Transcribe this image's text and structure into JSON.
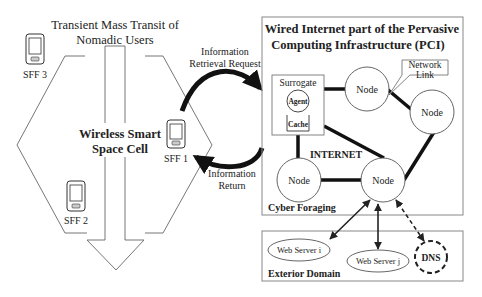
{
  "left": {
    "title_line1": "Transient Mass Transit of",
    "title_line2": "Nomadic Users",
    "cell_line1": "Wireless Smart",
    "cell_line2": "Space Cell",
    "devices": [
      {
        "label": "SFF 3"
      },
      {
        "label": "SFF 1"
      },
      {
        "label": "SFF 2"
      }
    ]
  },
  "arrows": {
    "request_line1": "Information",
    "request_line2": "Retrieval Request",
    "return_line1": "Information",
    "return_line2": "Return"
  },
  "pci": {
    "title_line1": "Wired Internet part of the Pervasive",
    "title_line2": "Computing Infrastructure (PCI)",
    "surrogate_label": "Surrogate",
    "agent_label": "Agent",
    "cache_label": "Cache",
    "network_link_line1": "Network",
    "network_link_line2": "Link",
    "internet_label": "INTERNET",
    "node_label": "Node",
    "footer_label": "Cyber Foraging"
  },
  "exterior": {
    "web_server_i": "Web Server i",
    "web_server_j": "Web Server j",
    "dns": "DNS",
    "footer_label": "Exterior Domain"
  },
  "colors": {
    "stroke": "#222222",
    "box": "#888888",
    "background": "#ffffff"
  }
}
